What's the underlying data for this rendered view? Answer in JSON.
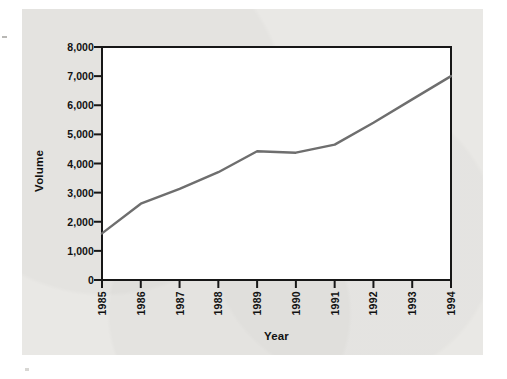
{
  "figure": {
    "background_color": "#e9e8e5",
    "page_color": "#ffffff"
  },
  "chart_data": {
    "type": "line",
    "title": "",
    "xlabel": "Year",
    "ylabel": "Volume",
    "categories": [
      "1985",
      "1986",
      "1987",
      "1988",
      "1989",
      "1990",
      "1991",
      "1992",
      "1993",
      "1994"
    ],
    "x": [
      1985,
      1986,
      1987,
      1988,
      1989,
      1990,
      1991,
      1992,
      1993,
      1994
    ],
    "values": [
      1600,
      2620,
      3130,
      3700,
      4420,
      4370,
      4650,
      5400,
      6200,
      7000
    ],
    "series": [
      {
        "name": "Volume",
        "color": "#6e6e6e",
        "values": [
          1600,
          2620,
          3130,
          3700,
          4420,
          4370,
          4650,
          5400,
          6200,
          7000
        ]
      }
    ],
    "ylim": [
      0,
      8000
    ],
    "xlim": [
      1985,
      1994
    ],
    "ytick_labels": [
      "0",
      "1,000",
      "2,000",
      "3,000",
      "4,000",
      "5,000",
      "6,000",
      "7,000",
      "8,000"
    ],
    "ytick_values": [
      0,
      1000,
      2000,
      3000,
      4000,
      5000,
      6000,
      7000,
      8000
    ],
    "xtick_labels": [
      "1985",
      "1986",
      "1987",
      "1988",
      "1989",
      "1990",
      "1991",
      "1992",
      "1993",
      "1994"
    ],
    "grid": false,
    "legend": false,
    "legend_position": "none",
    "line_color": "#6e6e6e",
    "axis_color": "#171717"
  }
}
